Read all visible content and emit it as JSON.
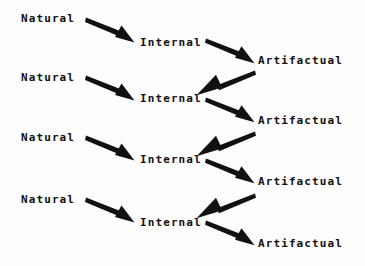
{
  "diagram": {
    "background_color": "#fdfdfd",
    "ink_color": "#111111",
    "labels": {
      "natural": "Natural",
      "internal": "Internal",
      "artifactual": "Artifactual"
    },
    "nodes": [
      {
        "id": "natural-1",
        "text": "Natural",
        "x": 21,
        "y": 13
      },
      {
        "id": "internal-1",
        "text": "Internal",
        "x": 140,
        "y": 37
      },
      {
        "id": "artifactual-1",
        "text": "Artifactual",
        "x": 258,
        "y": 55
      },
      {
        "id": "natural-2",
        "text": "Natural",
        "x": 21,
        "y": 72
      },
      {
        "id": "internal-2",
        "text": "Internal",
        "x": 140,
        "y": 93
      },
      {
        "id": "artifactual-2",
        "text": "Artifactual",
        "x": 258,
        "y": 115
      },
      {
        "id": "natural-3",
        "text": "Natural",
        "x": 21,
        "y": 132
      },
      {
        "id": "internal-3",
        "text": "Internal",
        "x": 140,
        "y": 154
      },
      {
        "id": "artifactual-3",
        "text": "Artifactual",
        "x": 258,
        "y": 176
      },
      {
        "id": "natural-4",
        "text": "Natural",
        "x": 21,
        "y": 194
      },
      {
        "id": "internal-4",
        "text": "Internal",
        "x": 140,
        "y": 217
      },
      {
        "id": "artifactual-4",
        "text": "Artifactual",
        "x": 258,
        "y": 238
      }
    ],
    "arrows": [
      {
        "id": "arrow-natural-1-to-internal-1",
        "from": "natural-1",
        "to": "internal-1",
        "x1": 86,
        "y1": 19,
        "x2": 136,
        "y2": 41
      },
      {
        "id": "arrow-internal-1-to-artifactual-1",
        "from": "internal-1",
        "to": "artifactual-1",
        "x1": 206,
        "y1": 40,
        "x2": 254,
        "y2": 61
      },
      {
        "id": "arrow-artifactual-1-to-internal-2",
        "from": "artifactual-1",
        "to": "internal-2",
        "x1": 255,
        "y1": 72,
        "x2": 199,
        "y2": 93
      },
      {
        "id": "arrow-natural-2-to-internal-2",
        "from": "natural-2",
        "to": "internal-2",
        "x1": 86,
        "y1": 78,
        "x2": 136,
        "y2": 99
      },
      {
        "id": "arrow-internal-2-to-artifactual-2",
        "from": "internal-2",
        "to": "artifactual-2",
        "x1": 206,
        "y1": 99,
        "x2": 254,
        "y2": 120
      },
      {
        "id": "arrow-artifactual-2-to-internal-3",
        "from": "artifactual-2",
        "to": "internal-3",
        "x1": 255,
        "y1": 133,
        "x2": 199,
        "y2": 153
      },
      {
        "id": "arrow-natural-3-to-internal-3",
        "from": "natural-3",
        "to": "internal-3",
        "x1": 86,
        "y1": 138,
        "x2": 136,
        "y2": 159
      },
      {
        "id": "arrow-internal-3-to-artifactual-3",
        "from": "internal-3",
        "to": "artifactual-3",
        "x1": 206,
        "y1": 160,
        "x2": 254,
        "y2": 181
      },
      {
        "id": "arrow-artifactual-3-to-internal-4",
        "from": "artifactual-3",
        "to": "internal-4",
        "x1": 255,
        "y1": 195,
        "x2": 199,
        "y2": 216
      },
      {
        "id": "arrow-natural-4-to-internal-4",
        "from": "natural-4",
        "to": "internal-4",
        "x1": 86,
        "y1": 200,
        "x2": 136,
        "y2": 222
      },
      {
        "id": "arrow-internal-4-to-artifactual-4",
        "from": "internal-4",
        "to": "artifactual-4",
        "x1": 206,
        "y1": 222,
        "x2": 254,
        "y2": 243
      }
    ]
  }
}
